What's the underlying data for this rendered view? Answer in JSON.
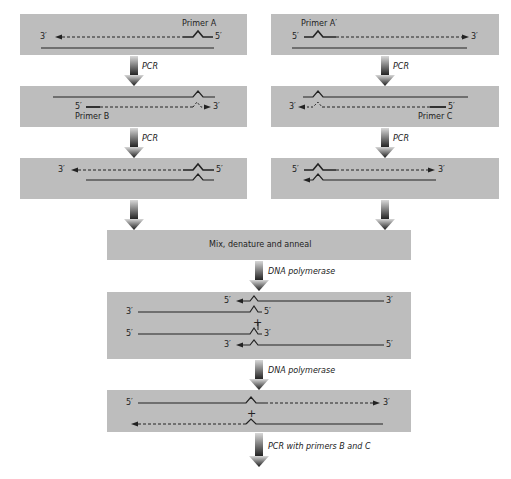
{
  "colors": {
    "box": "#bdbdbd",
    "line": "#222222",
    "arrow_top": "#d0d0d0",
    "arrow_bottom": "#1a1a1a"
  },
  "left_column": {
    "step1": {
      "primer_label": "Primer A",
      "end_left": "3′",
      "end_right": "5′"
    },
    "arrow1_label": "PCR",
    "step2": {
      "primer_label": "Primer B",
      "end_left": "5′",
      "end_right": "3′"
    },
    "arrow2_label": "PCR",
    "step3": {
      "end_left": "3′",
      "end_right": "5′"
    }
  },
  "right_column": {
    "step1": {
      "primer_label": "Primer A′",
      "end_left": "5′",
      "end_right": "3′"
    },
    "arrow1_label": "PCR",
    "step2": {
      "primer_label": "Primer C",
      "end_left": "3′",
      "end_right": "5′"
    },
    "arrow2_label": "PCR",
    "step3": {
      "end_left": "5′",
      "end_right": "3′"
    }
  },
  "mix_box": {
    "label": "Mix, denature and anneal"
  },
  "arrow_mix_label": "DNA polymerase",
  "middle_box": {
    "row1": {
      "left": "5′",
      "right": "3′"
    },
    "row2": {
      "left": "3′",
      "right": "5′"
    },
    "plus": "+",
    "row3": {
      "left": "5′",
      "right": "3′"
    },
    "row4": {
      "left": "3′",
      "right": "5′"
    }
  },
  "arrow_middle_label": "DNA polymerase",
  "final_box": {
    "row1": {
      "left": "5′",
      "right": "3′"
    },
    "plus": "+"
  },
  "arrow_final_label": "PCR with primers B and C"
}
